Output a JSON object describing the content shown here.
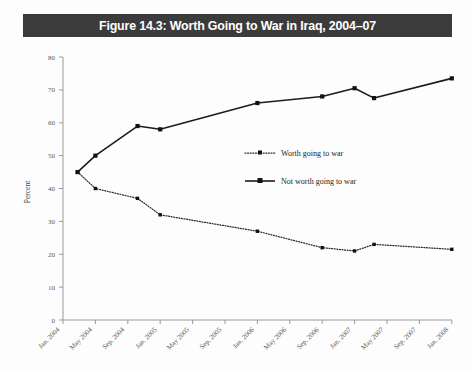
{
  "figure": {
    "title": "Figure 14.3: Worth Going to War in Iraq, 2004–07",
    "title_bg_color": "#3b3b3b",
    "title_text_color": "#ffffff",
    "background_color": "#fdfdfd"
  },
  "chart_data": {
    "type": "line",
    "title": "Figure 14.3: Worth Going to War in Iraq, 2004–07",
    "xlabel": "",
    "ylabel": "Percent",
    "ylim": [
      0,
      80
    ],
    "ytick_values": [
      0,
      10,
      20,
      30,
      40,
      50,
      60,
      70,
      80
    ],
    "ytick_labels": [
      "0",
      "10",
      "20",
      "30",
      "40",
      "50",
      "60",
      "70",
      "80"
    ],
    "xtick_labels": [
      "Jan. 2004",
      "May 2004",
      "Sep. 2004",
      "Jan. 2005",
      "May 2005",
      "Sep. 2005",
      "Jan. 2006",
      "May 2006",
      "Sep. 2006",
      "Jan. 2007",
      "May 2007",
      "Sep. 2007",
      "Jan. 2008"
    ],
    "x": [
      "Mar. 2004",
      "May 2004",
      "Oct. 2004",
      "Dec. 2004",
      "Jan. 2006",
      "Sep. 2006",
      "Jan. 2007",
      "Mar. 2007",
      "Dec. 2007"
    ],
    "grid": false,
    "legend_position": "center",
    "series": [
      {
        "name": "Worth going to war",
        "style": "dotted",
        "marker": "square",
        "values": [
          45,
          40,
          37,
          32,
          27,
          22,
          21,
          23,
          21.5
        ]
      },
      {
        "name": "Not worth going to war",
        "style": "solid",
        "marker": "square",
        "values": [
          45,
          50,
          59,
          58,
          66,
          68,
          70.5,
          67.5,
          73.5
        ]
      }
    ]
  },
  "legend": {
    "entries": [
      {
        "label": "Worth going to war",
        "style": "dotted"
      },
      {
        "label": "Not worth going to war",
        "style": "solid"
      }
    ]
  },
  "axis": {
    "y_title": "Percent"
  }
}
